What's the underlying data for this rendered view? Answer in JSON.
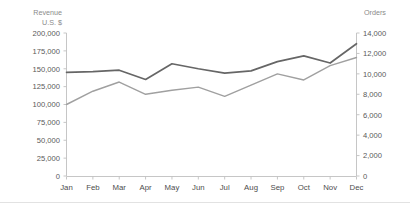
{
  "chart_data": {
    "type": "line",
    "title": "",
    "subtitle": "",
    "xlabel": "",
    "ylabel": "Revenue U.S. $",
    "y2label": "Orders",
    "grid": false,
    "legend": "none",
    "categories": [
      "Jan",
      "Feb",
      "Mar",
      "Apr",
      "May",
      "Jun",
      "Jul",
      "Aug",
      "Sep",
      "Oct",
      "Nov",
      "Dec"
    ],
    "series": [
      {
        "name": "Revenue",
        "axis": "left",
        "color": "#666666",
        "values": [
          145000,
          146000,
          148000,
          135000,
          157000,
          150000,
          144000,
          147000,
          160000,
          168000,
          158000,
          185000
        ]
      },
      {
        "name": "Orders",
        "axis": "right",
        "color": "#a0a0a0",
        "values": [
          7000,
          8300,
          9200,
          8000,
          8400,
          8700,
          7800,
          8900,
          10000,
          9400,
          10800,
          11600
        ]
      }
    ],
    "ylim": [
      0,
      200000
    ],
    "y2lim": [
      0,
      14000
    ],
    "yticks": [
      0,
      25000,
      50000,
      75000,
      100000,
      125000,
      150000,
      175000,
      200000
    ],
    "yticklabels": [
      "0",
      "25,000",
      "50,000",
      "75,000",
      "100,000",
      "125,000",
      "150,000",
      "175,000",
      "200,000"
    ],
    "y2ticks": [
      0,
      2000,
      4000,
      6000,
      8000,
      10000,
      12000,
      14000
    ],
    "y2ticklabels": [
      "0",
      "2,000",
      "4,000",
      "6,000",
      "8,000",
      "10,000",
      "12,000",
      "14,000"
    ]
  },
  "left_axis_title_lines": [
    "Revenue",
    "U.S. $"
  ],
  "right_axis_title": "Orders",
  "colors": {
    "revenue_line": "#666666",
    "orders_line": "#a0a0a0",
    "axis": "#bfbfbf",
    "tick_text": "#595959",
    "axis_title_text": "#8a8a8a",
    "background": "#ffffff"
  }
}
